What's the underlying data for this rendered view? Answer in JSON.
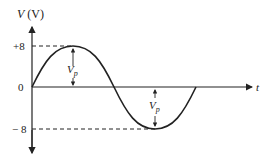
{
  "figure": {
    "y_axis_label_var": "V",
    "y_axis_label_unit": "(V)",
    "x_axis_label": "t",
    "ticks": {
      "pos": "+8",
      "zero": "0",
      "neg": "− 8"
    },
    "amplitude_label_main": "V",
    "amplitude_label_sub": "p",
    "colors": {
      "stroke": "#222222",
      "background": "#ffffff"
    }
  }
}
